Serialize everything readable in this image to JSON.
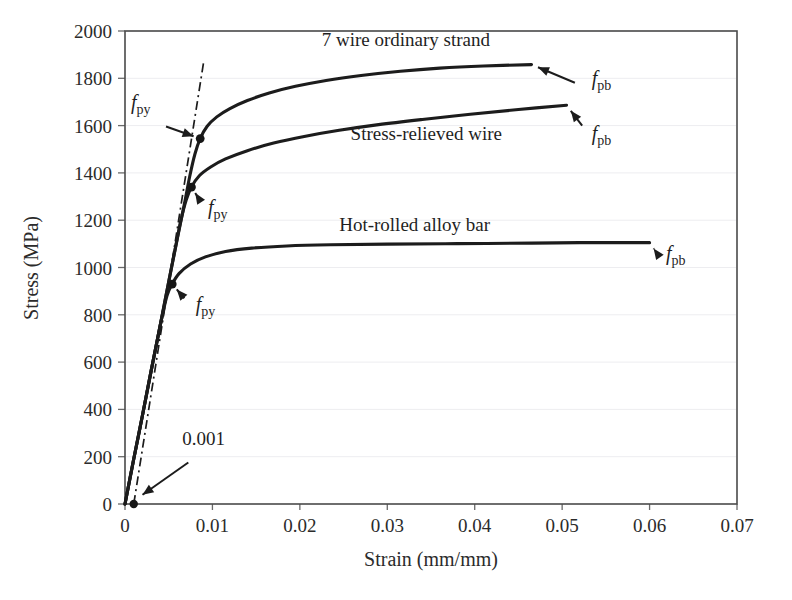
{
  "chart_data": {
    "type": "line",
    "title": "",
    "xlabel": "Strain (mm/mm)",
    "ylabel": "Stress (MPa)",
    "xlim": [
      0,
      0.07
    ],
    "ylim": [
      0,
      2000
    ],
    "xticks": [
      "0",
      "0.01",
      "0.02",
      "0.03",
      "0.04",
      "0.05",
      "0.06",
      "0.07"
    ],
    "xtick_values": [
      0,
      0.01,
      0.02,
      0.03,
      0.04,
      0.05,
      0.06,
      0.07
    ],
    "yticks": [
      "0",
      "200",
      "400",
      "600",
      "800",
      "1000",
      "1200",
      "1400",
      "1600",
      "1800",
      "2000"
    ],
    "ytick_values": [
      0,
      200,
      400,
      600,
      800,
      1000,
      1200,
      1400,
      1600,
      1800,
      2000
    ],
    "grid": "faint-horizontal",
    "legend": "inline-labels",
    "series": [
      {
        "name": "7 wire ordinary strand",
        "label_x": 0.0225,
        "label_y": 1935,
        "points": [
          [
            0.0,
            0
          ],
          [
            0.001,
            190
          ],
          [
            0.002,
            375
          ],
          [
            0.003,
            565
          ],
          [
            0.004,
            750
          ],
          [
            0.005,
            940
          ],
          [
            0.006,
            1125
          ],
          [
            0.0068,
            1270
          ],
          [
            0.0074,
            1385
          ],
          [
            0.008,
            1480
          ],
          [
            0.0086,
            1545
          ],
          [
            0.0094,
            1597
          ],
          [
            0.0105,
            1637
          ],
          [
            0.012,
            1672
          ],
          [
            0.014,
            1706
          ],
          [
            0.0165,
            1738
          ],
          [
            0.0195,
            1766
          ],
          [
            0.023,
            1791
          ],
          [
            0.027,
            1812
          ],
          [
            0.0315,
            1830
          ],
          [
            0.036,
            1843
          ],
          [
            0.041,
            1852
          ],
          [
            0.0465,
            1858
          ]
        ],
        "fpy": {
          "strain": 0.0086,
          "stress": 1545
        },
        "fpb": {
          "strain": 0.0465,
          "stress": 1858
        }
      },
      {
        "name": "Stress-relieved wire",
        "label_x": 0.0258,
        "label_y": 1540,
        "points": [
          [
            0.0,
            0
          ],
          [
            0.001,
            190
          ],
          [
            0.002,
            375
          ],
          [
            0.003,
            565
          ],
          [
            0.004,
            750
          ],
          [
            0.005,
            940
          ],
          [
            0.0058,
            1090
          ],
          [
            0.0064,
            1200
          ],
          [
            0.007,
            1285
          ],
          [
            0.0076,
            1340
          ],
          [
            0.0085,
            1388
          ],
          [
            0.0098,
            1425
          ],
          [
            0.0115,
            1459
          ],
          [
            0.014,
            1494
          ],
          [
            0.017,
            1526
          ],
          [
            0.0205,
            1554
          ],
          [
            0.0245,
            1580
          ],
          [
            0.029,
            1604
          ],
          [
            0.034,
            1626
          ],
          [
            0.0395,
            1648
          ],
          [
            0.045,
            1668
          ],
          [
            0.0505,
            1686
          ]
        ],
        "fpy": {
          "strain": 0.0076,
          "stress": 1340
        },
        "fpb": {
          "strain": 0.0505,
          "stress": 1686
        }
      },
      {
        "name": "Hot-rolled alloy bar",
        "label_x": 0.0245,
        "label_y": 1155,
        "points": [
          [
            0.0,
            0
          ],
          [
            0.001,
            190
          ],
          [
            0.002,
            375
          ],
          [
            0.003,
            565
          ],
          [
            0.004,
            750
          ],
          [
            0.0048,
            880
          ],
          [
            0.0054,
            930
          ],
          [
            0.0062,
            975
          ],
          [
            0.0075,
            1015
          ],
          [
            0.0092,
            1045
          ],
          [
            0.0115,
            1068
          ],
          [
            0.0145,
            1082
          ],
          [
            0.0185,
            1091
          ],
          [
            0.0235,
            1096
          ],
          [
            0.03,
            1099
          ],
          [
            0.038,
            1101
          ],
          [
            0.0465,
            1103
          ],
          [
            0.052,
            1105
          ],
          [
            0.06,
            1105
          ]
        ],
        "fpy": {
          "strain": 0.0054,
          "stress": 930
        },
        "fpb": {
          "strain": 0.06,
          "stress": 1105
        }
      }
    ],
    "offset_line": {
      "label": "0.001",
      "label_x": 0.009,
      "label_y": 248,
      "start": [
        0.001,
        0
      ],
      "end": [
        0.009,
        1870
      ],
      "style": "dash-dot"
    },
    "annotations": [
      {
        "text_italic": "f",
        "text_sub": "py",
        "x": 0.0018,
        "y": 1672,
        "target_strain": 0.0086,
        "target_stress": 1545
      },
      {
        "text_italic": "f",
        "text_sub": "py",
        "x": 0.0106,
        "y": 1228,
        "target_strain": 0.0076,
        "target_stress": 1340
      },
      {
        "text_italic": "f",
        "text_sub": "py",
        "x": 0.0092,
        "y": 818,
        "target_strain": 0.0054,
        "target_stress": 930
      },
      {
        "text_italic": "f",
        "text_sub": "pb",
        "x": 0.0545,
        "y": 1770,
        "target_strain": 0.0465,
        "target_stress": 1858
      },
      {
        "text_italic": "f",
        "text_sub": "pb",
        "x": 0.0545,
        "y": 1540,
        "target_strain": 0.0505,
        "target_stress": 1686
      },
      {
        "text_italic": "f",
        "text_sub": "pb",
        "x": 0.063,
        "y": 1032,
        "target_strain": 0.06,
        "target_stress": 1105
      }
    ]
  }
}
